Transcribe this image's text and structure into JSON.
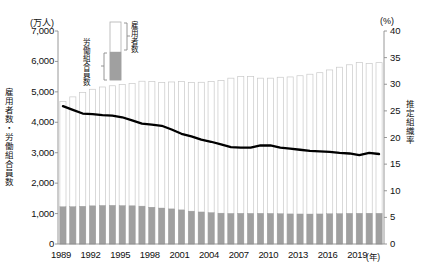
{
  "chart_data": {
    "type": "bar",
    "title": "",
    "subtitle": "",
    "xlabel": "(年)",
    "ylabel": "雇用者数・労働組合員数",
    "ylabel_unit": "(万人)",
    "y2label": "推定組織率",
    "y2label_unit": "(%)",
    "ylim": [
      0,
      7000
    ],
    "y2lim": [
      0,
      40
    ],
    "yticks": [
      "0",
      "1,000",
      "2,000",
      "3,000",
      "4,000",
      "5,000",
      "6,000",
      "7,000"
    ],
    "ytick_values": [
      0,
      1000,
      2000,
      3000,
      4000,
      5000,
      6000,
      7000
    ],
    "y2ticks": [
      "0",
      "5",
      "10",
      "15",
      "20",
      "25",
      "30",
      "35",
      "40"
    ],
    "y2tick_values": [
      0,
      5,
      10,
      15,
      20,
      25,
      30,
      35,
      40
    ],
    "grid": false,
    "legend_position": "top-center",
    "legend": [
      {
        "label": "雇用者数",
        "color": "#ffffff",
        "swatch": "white-bar"
      },
      {
        "label": "労働組合員数",
        "color": "#a0a0a0",
        "swatch": "gray-bar"
      }
    ],
    "x": [
      1989,
      1990,
      1991,
      1992,
      1993,
      1994,
      1995,
      1996,
      1997,
      1998,
      1999,
      2000,
      2001,
      2002,
      2003,
      2004,
      2005,
      2006,
      2007,
      2008,
      2009,
      2010,
      2011,
      2012,
      2013,
      2014,
      2015,
      2016,
      2017,
      2018,
      2019,
      2020,
      2021
    ],
    "xtick_labels": [
      "1989",
      "1992",
      "1995",
      "1998",
      "2001",
      "2004",
      "2007",
      "2010",
      "2013",
      "2016",
      "2019"
    ],
    "xtick_values": [
      1989,
      1992,
      1995,
      1998,
      2001,
      2004,
      2007,
      2010,
      2013,
      2016,
      2019
    ],
    "series": [
      {
        "name": "雇用者数",
        "unit": "万人",
        "axis": "left",
        "type": "bar",
        "color": "#ffffff",
        "values": [
          4679,
          4835,
          4975,
          5085,
          5160,
          5200,
          5240,
          5280,
          5350,
          5340,
          5310,
          5325,
          5340,
          5310,
          5315,
          5340,
          5375,
          5450,
          5505,
          5500,
          5450,
          5450,
          5480,
          5490,
          5530,
          5580,
          5630,
          5720,
          5810,
          5890,
          5970,
          5930,
          5960
        ]
      },
      {
        "name": "労働組合員数",
        "unit": "万人",
        "axis": "left",
        "type": "bar",
        "color": "#a0a0a0",
        "values": [
          1223,
          1226,
          1240,
          1254,
          1266,
          1270,
          1261,
          1255,
          1245,
          1209,
          1182,
          1154,
          1121,
          1080,
          1053,
          1031,
          1014,
          1004,
          1008,
          1006,
          1008,
          1005,
          996,
          989,
          987,
          985,
          988,
          994,
          998,
          1007,
          1009,
          1011,
          1008
        ]
      },
      {
        "name": "推定組織率",
        "unit": "%",
        "axis": "right",
        "type": "line",
        "color": "#000000",
        "values": [
          25.9,
          25.2,
          24.5,
          24.4,
          24.2,
          24.1,
          23.8,
          23.2,
          22.6,
          22.4,
          22.2,
          21.5,
          20.7,
          20.2,
          19.6,
          19.2,
          18.7,
          18.2,
          18.1,
          18.1,
          18.5,
          18.5,
          18.1,
          17.9,
          17.7,
          17.5,
          17.4,
          17.3,
          17.1,
          17.0,
          16.7,
          17.1,
          16.9
        ]
      }
    ]
  }
}
